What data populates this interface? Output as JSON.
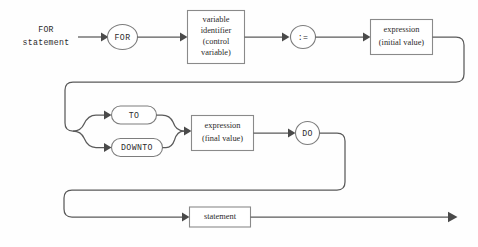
{
  "diagram": {
    "type": "railroad-syntax-diagram",
    "title": "FOR statement",
    "language": "Pascal",
    "entry_label": {
      "line1": "FOR",
      "line2": "statement"
    },
    "nodes": {
      "kw_for": {
        "text": "FOR",
        "shape": "circle",
        "kind": "terminal"
      },
      "variable_identifier": {
        "line1": "variable",
        "line2": "identifier",
        "line3": "(control",
        "line4": "variable)",
        "shape": "rect",
        "kind": "nonterminal"
      },
      "assign_op": {
        "text": ":=",
        "shape": "circle",
        "kind": "terminal"
      },
      "expr_initial": {
        "line1": "expression",
        "line2": "(initial value)",
        "shape": "rect",
        "kind": "nonterminal"
      },
      "kw_to": {
        "text": "TO",
        "shape": "stadium",
        "kind": "terminal"
      },
      "kw_downto": {
        "text": "DOWNTO",
        "shape": "stadium",
        "kind": "terminal"
      },
      "expr_final": {
        "line1": "expression",
        "line2": "(final value)",
        "shape": "rect",
        "kind": "nonterminal"
      },
      "kw_do": {
        "text": "DO",
        "shape": "circle",
        "kind": "terminal"
      },
      "statement": {
        "text": "statement",
        "shape": "rect",
        "kind": "nonterminal"
      }
    },
    "colors": {
      "rail": "#5a5a5a",
      "node_stroke": "#8a8a8a",
      "node_fill": "#ffffff",
      "text": "#2b2b2b",
      "background": "#fefefe"
    },
    "rows": [
      "row1-for-variable-assign-initial",
      "row2-to-downto-final-do",
      "row3-statement-exit"
    ]
  }
}
